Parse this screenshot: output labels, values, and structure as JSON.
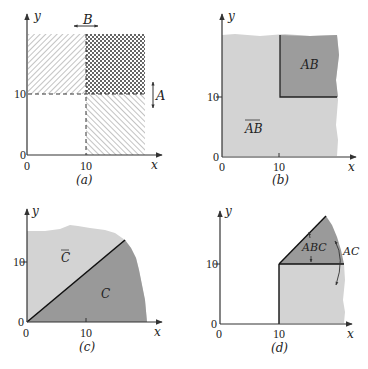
{
  "figure": {
    "panels": [
      {
        "id": "a",
        "caption": "(a)",
        "x_axis_label": "x",
        "y_axis_label": "y",
        "x_ticks": [
          "0",
          "10"
        ],
        "y_ticks": [
          "0",
          "10"
        ],
        "event_labels": {
          "A": "A",
          "B": "B"
        },
        "description": "Event A: y > 10 (diagonal hatch upper band); Event B: x > 10 (diagonal hatch right band); overlap cross-hatched"
      },
      {
        "id": "b",
        "caption": "(b)",
        "x_axis_label": "x",
        "y_axis_label": "y",
        "x_ticks": [
          "0",
          "10"
        ],
        "y_ticks": [
          "0",
          "10"
        ],
        "region_labels": {
          "AB": "AB",
          "not_AB": "AB"
        },
        "description": "AB = region x>10, y>10 dark; complement light"
      },
      {
        "id": "c",
        "caption": "(c)",
        "x_axis_label": "x",
        "y_axis_label": "y",
        "x_ticks": [
          "0",
          "10"
        ],
        "y_ticks": [
          "0",
          "10"
        ],
        "region_labels": {
          "C": "C",
          "not_C": "C"
        },
        "description": "C = region below diagonal y < x dark; complement light"
      },
      {
        "id": "d",
        "caption": "(d)",
        "x_axis_label": "x",
        "y_axis_label": "y",
        "x_ticks": [
          "0",
          "10"
        ],
        "y_ticks": [
          "0",
          "10"
        ],
        "region_labels": {
          "ABC": "ABC",
          "AC": "AC"
        },
        "description": "AC = x>10, y<x light; ABC = x>10, 10<y<x dark"
      }
    ],
    "colors": {
      "light_fill": "#d4d4d4",
      "dark_fill": "#9a9a9a",
      "axis": "#333333",
      "hatch": "#777777"
    }
  }
}
